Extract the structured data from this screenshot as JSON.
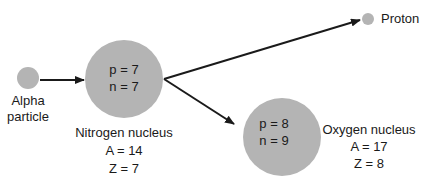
{
  "colors": {
    "particle": "#b4b4b4",
    "arrow": "#1a1a1a",
    "text": "#1a1a1a"
  },
  "alpha": {
    "label_line1": "Alpha",
    "label_line2": "particle"
  },
  "nitrogen": {
    "p": "p = 7",
    "n": "n = 7",
    "name": "Nitrogen nucleus",
    "A": "A = 14",
    "Z": "Z = 7"
  },
  "oxygen": {
    "p": "p = 8",
    "n": "n = 9",
    "name": "Oxygen nucleus",
    "A": "A = 17",
    "Z": "Z = 8"
  },
  "proton": {
    "label": "Proton"
  }
}
